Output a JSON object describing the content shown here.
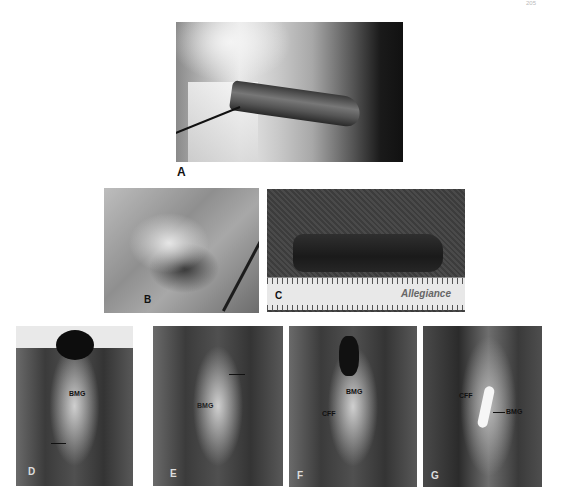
{
  "page": {
    "page_number": "205"
  },
  "figure": {
    "panels": [
      {
        "id": "A",
        "label": "A",
        "content": "retrograde urethrogram (fluoroscopy)",
        "annotations": []
      },
      {
        "id": "B",
        "label": "B",
        "content": "intraoperative harvest photo",
        "annotations": []
      },
      {
        "id": "C",
        "label": "C",
        "content": "harvested graft on ruler",
        "annotations": [],
        "ruler_brand": "Allegiance"
      },
      {
        "id": "D",
        "label": "D",
        "content": "graft placement",
        "annotations": [
          "BMG"
        ]
      },
      {
        "id": "E",
        "label": "E",
        "content": "graft placement",
        "annotations": [
          "BMG"
        ]
      },
      {
        "id": "F",
        "label": "F",
        "content": "graft with flap",
        "annotations": [
          "BMG",
          "CFF"
        ]
      },
      {
        "id": "G",
        "label": "G",
        "content": "graft with flap",
        "annotations": [
          "CFF",
          "BMG"
        ]
      }
    ]
  }
}
